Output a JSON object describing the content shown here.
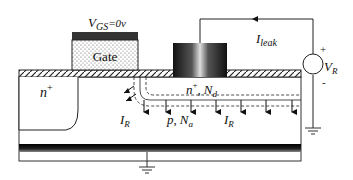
{
  "diagram": {
    "gate": {
      "label": "Gate",
      "bias_label_main": "V",
      "bias_label_sub": "GS",
      "bias_label_value": "=0v"
    },
    "source": {
      "label_main": "n",
      "label_sup": "+"
    },
    "drain": {
      "label_main": "n",
      "label_sup": "+",
      "label_sep": ",",
      "doping_main": "N",
      "doping_sub": "d"
    },
    "substrate": {
      "label_main": "p",
      "label_sep": ",",
      "doping_main": "N",
      "doping_sub": "a"
    },
    "currents": {
      "leak_main": "I",
      "leak_sub": "leak",
      "reverse_left_main": "I",
      "reverse_left_sub": "R",
      "reverse_right_main": "I",
      "reverse_right_sub": "R"
    },
    "voltage_source": {
      "label_main": "V",
      "label_sub": "R",
      "plus": "+",
      "minus": "-"
    },
    "colors": {
      "line": "#111111",
      "oxide_hatch": "#222222",
      "gate_cap": "#333333",
      "back_contact": "#1a1a1a"
    }
  }
}
